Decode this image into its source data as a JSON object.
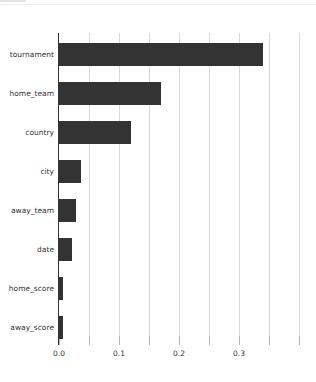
{
  "window": {
    "background": "#ffffff"
  },
  "chart_data": {
    "type": "bar",
    "orientation": "horizontal",
    "title": "",
    "xlabel": "",
    "ylabel": "",
    "categories": [
      "tournament",
      "home_team",
      "country",
      "city",
      "away_team",
      "date",
      "home_score",
      "away_score"
    ],
    "values": [
      0.34,
      0.17,
      0.12,
      0.037,
      0.029,
      0.021,
      0.007,
      0.006
    ],
    "xlim": [
      0,
      0.405
    ],
    "x_tick_values": [
      0.0,
      0.1,
      0.2,
      0.3
    ],
    "x_tick_labels": [
      "0.0",
      "0.1",
      "0.2",
      "0.3"
    ],
    "x_grid_step": 0.05,
    "grid": true,
    "legend": false,
    "bar_color": "#333333",
    "grid_color": "#d9d9d9",
    "axis_line_color": "#333333",
    "tick_color": "#b2b2b2",
    "text_color": "#333333"
  }
}
